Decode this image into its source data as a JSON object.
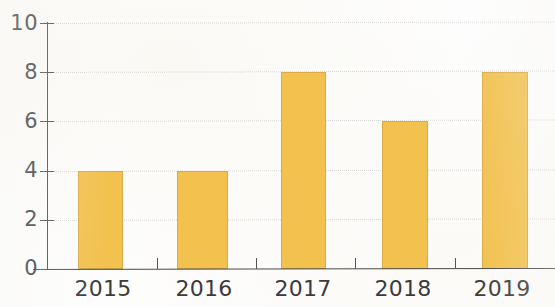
{
  "chart_data": {
    "type": "bar",
    "title": "",
    "subtitle": "",
    "xlabel": "",
    "ylabel": "",
    "categories": [
      "2015",
      "2016",
      "2017",
      "2018",
      "2019"
    ],
    "values": [
      4,
      4,
      8,
      6,
      8
    ],
    "ylim": [
      0,
      10
    ],
    "ytick_labels": [
      "0",
      "2",
      "4",
      "6",
      "8",
      "10"
    ],
    "ytick_values": [
      0,
      2,
      4,
      6,
      8,
      10
    ],
    "grid": true,
    "grid_axis": "y",
    "legend": false,
    "legend_position": "none",
    "bar_color": "#f2c14e",
    "bar_edge_color": "#d9ab48",
    "axis_color": "#4a4a4a",
    "grid_color": "#cfcfcf",
    "text_color": "#3b3b3b",
    "background_color": "#fefefe"
  }
}
